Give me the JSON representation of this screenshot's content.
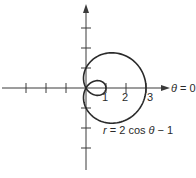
{
  "chart_data": {
    "type": "polar-curve",
    "title": "",
    "equation": {
      "r": "r",
      "equals": "=",
      "rhs": "2 cos θ − 1"
    },
    "axis_label_theta0": {
      "theta": "θ",
      "rest": "= 0"
    },
    "origin_px": [
      86,
      88
    ],
    "scale_px_per_unit": 20,
    "x_tick_values": [
      -3,
      -2,
      -1,
      1,
      2,
      3
    ],
    "x_tick_labels": [
      "1",
      "2",
      "3"
    ],
    "y_tick_values": [
      -3,
      -2,
      -1,
      1,
      2,
      3
    ],
    "x_range": [
      -4.2,
      3.9
    ],
    "y_range": [
      -4.1,
      4.2
    ],
    "grid": false,
    "curve_samples": 180,
    "curve_color": "#2a2a2a",
    "axis_color": "#3a3a3a"
  },
  "labels": {
    "tick_1": "1",
    "tick_2": "2",
    "tick_3": "3",
    "theta": "θ",
    "theta_rest": " = 0",
    "eq_r": "r",
    "eq_rest_a": " = 2 cos ",
    "eq_theta": "θ",
    "eq_rest_b": " − 1"
  }
}
